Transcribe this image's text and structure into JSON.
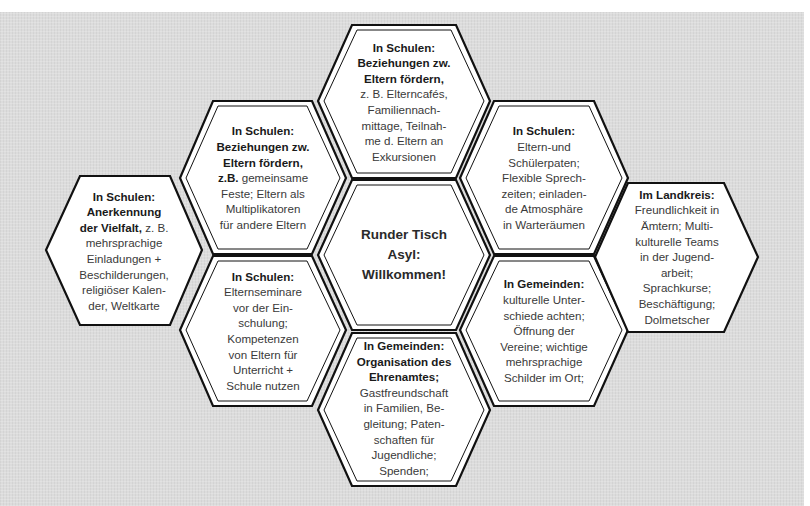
{
  "diagram": {
    "center": {
      "lines": [
        "Runder Tisch",
        "Asyl:",
        "Willkommen!"
      ]
    },
    "hexagons": [
      {
        "id": "top",
        "title_lines": [
          "In Schulen:",
          "Beziehungen zw.",
          "Eltern fördern,"
        ],
        "body_lines": [
          "z. B. Elterncafés,",
          "Familiennach-",
          "mittage, Teilnah-",
          "me d. Eltern an",
          "Exkursionen"
        ]
      },
      {
        "id": "upper-left",
        "title_lines": [
          "In Schulen:",
          "Beziehungen zw.",
          "Eltern fördern,"
        ],
        "mixed_line": {
          "bold": "z.B.",
          "normal": " gemeinsame"
        },
        "body_lines": [
          "Feste; Eltern als",
          "Multiplikatoren",
          "für andere Eltern"
        ]
      },
      {
        "id": "far-left",
        "title_lines": [
          "In Schulen:",
          "Anerkennung"
        ],
        "mixed_line": {
          "bold": "der Vielfalt,",
          "normal": " z. B."
        },
        "body_lines": [
          "mehrsprachige",
          "Einladungen +",
          "Beschilderungen,",
          "religiöser Kalen-",
          "der, Weltkarte"
        ]
      },
      {
        "id": "lower-left",
        "title_lines": [
          "In Schulen:"
        ],
        "body_lines": [
          "Elternseminare",
          "vor der Ein-",
          "schulung;",
          "Kompetenzen",
          "von Eltern für",
          "Unterricht +",
          "Schule nutzen"
        ]
      },
      {
        "id": "bottom",
        "title_lines": [
          "In Gemeinden:",
          "Organisation des",
          "Ehrenamtes;"
        ],
        "body_lines": [
          "Gastfreundschaft",
          "in Familien,  Be-",
          "gleitung; Paten-",
          "schaften für",
          "Jugendliche;",
          "Spenden;"
        ]
      },
      {
        "id": "upper-right",
        "title_lines": [
          "In Schulen:"
        ],
        "body_lines": [
          "Eltern-und",
          "Schülerpaten;",
          "Flexible Sprech-",
          "zeiten; einladen-",
          "de Atmosphäre",
          "in Warteräumen"
        ]
      },
      {
        "id": "lower-right",
        "title_lines": [
          "In Gemeinden:"
        ],
        "body_lines": [
          "kulturelle  Unter-",
          "schiede  achten;",
          "Öffnung der",
          "Vereine; wichtige",
          "mehrsprachige",
          "Schilder im Ort;"
        ]
      },
      {
        "id": "far-right",
        "title_lines": [
          "Im Landkreis:"
        ],
        "body_lines": [
          "Freundlichkeit in",
          "Ämtern; Multi-",
          "kulturelle Teams",
          "in der Jugend-",
          "arbeit;",
          "Sprachkurse;",
          "Beschäftigung;",
          "Dolmetscher"
        ]
      }
    ]
  },
  "colors": {
    "background": "#dcdcdc",
    "hex_fill": "#ffffff",
    "hex_stroke": "#111111",
    "title_text": "#1a1a1a",
    "body_text": "#3a3a3a"
  }
}
